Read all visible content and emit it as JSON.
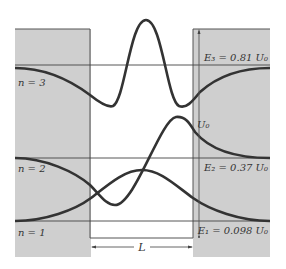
{
  "diagram": {
    "colors": {
      "barrier_fill": "#cfcfcf",
      "well_fill": "#ffffff",
      "curve": "#333333",
      "line": "#444444"
    },
    "levels": [
      {
        "n_label": "n = 3",
        "energy_label": "E₃ = 0.81 U₀",
        "value": "0.81"
      },
      {
        "n_label": "n = 2",
        "energy_label": "E₂ = 0.37 U₀",
        "value": "0.37"
      },
      {
        "n_label": "n = 1",
        "energy_label": "E₁ = 0.098 U₀",
        "value": "0.098"
      }
    ],
    "well_depth_label": "U₀",
    "well_width_label": "L"
  }
}
